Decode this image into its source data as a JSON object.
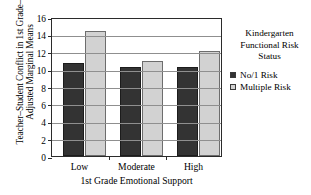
{
  "chart_data": {
    "type": "bar",
    "title": "",
    "categories": [
      "Low",
      "Moderate",
      "High"
    ],
    "series": [
      {
        "name": "No/1 Risk",
        "values": [
          10.7,
          10.3,
          10.3
        ],
        "color": "#333333"
      },
      {
        "name": "Multiple Risk",
        "values": [
          14.4,
          10.9,
          12.1
        ],
        "color": "#d2d2d2"
      }
    ],
    "xlabel": "1st Grade Emotional Support",
    "ylabel_lines": [
      "Teacher–Student Conflict in 1st Grade–",
      "Adjusted Marginal Means"
    ],
    "ylabel": "Teacher–Student Conflict in 1st Grade–Adjusted Marginal Means",
    "ylim": [
      0,
      16
    ],
    "yticks": [
      0,
      2,
      4,
      6,
      8,
      10,
      12,
      14,
      16
    ],
    "ytick_labels": [
      "0",
      "2",
      "4",
      "6",
      "8",
      "10",
      "12",
      "14",
      "16"
    ],
    "grid": true,
    "grid_axis": "y",
    "legend": {
      "position": "right",
      "title_lines": [
        "Kindergarten",
        "Functional Risk",
        "Status"
      ],
      "title": "Kindergarten Functional Risk Status",
      "entries": [
        {
          "label": "No/1 Risk",
          "color": "#333333"
        },
        {
          "label": "Multiple Risk",
          "color": "#d2d2d2"
        }
      ]
    }
  }
}
